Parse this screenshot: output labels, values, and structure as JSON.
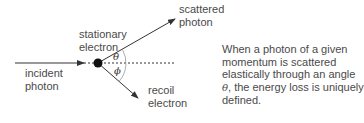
{
  "diagram": {
    "labels": {
      "scattered_photon_line1": "scattered",
      "scattered_photon_line2": "photon",
      "stationary_electron_line1": "stationary",
      "stationary_electron_line2": "electron",
      "incident_photon_line1": "incident",
      "incident_photon_line2": "photon",
      "recoil_electron_line1": "recoil",
      "recoil_electron_line2": "electron",
      "theta": "θ",
      "phi": "ϕ"
    },
    "caption": {
      "part1": "When a photon of a given momentum is scattered elastically through an angle ",
      "symbol": "θ",
      "part2": ", the energy loss is uniquely defined."
    },
    "colors": {
      "line": "#333333",
      "text": "#4a4a4a",
      "arc": "#999999",
      "dot": "#111111"
    }
  }
}
